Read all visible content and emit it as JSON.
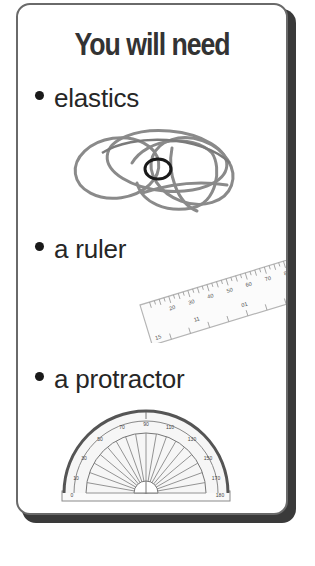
{
  "card": {
    "title": "You will need",
    "items": [
      {
        "label": "elastics",
        "icon": "elastic-bands-illustration"
      },
      {
        "label": "a ruler",
        "icon": "ruler-illustration"
      },
      {
        "label": "a protractor",
        "icon": "protractor-illustration"
      }
    ]
  },
  "ruler": {
    "top_labels": [
      "10",
      "20",
      "30",
      "40",
      "50",
      "60",
      "70",
      "80",
      "90",
      "100"
    ],
    "bottom_labels": [
      "15",
      "11",
      "01",
      "6"
    ]
  },
  "protractor": {
    "outer_labels": [
      "0",
      "10",
      "20",
      "30",
      "40",
      "50",
      "60",
      "70",
      "80",
      "90",
      "100",
      "110",
      "120",
      "130",
      "140",
      "150",
      "160",
      "170",
      "180"
    ],
    "inner_labels": [
      "180",
      "170",
      "160",
      "150",
      "140",
      "130",
      "120",
      "110",
      "100",
      "90",
      "80",
      "70",
      "60",
      "50",
      "40",
      "30",
      "20",
      "10",
      "0"
    ]
  },
  "colors": {
    "text": "#262626",
    "title": "#333333",
    "card_border": "#6a6a6a",
    "card_shadow": "#3a3a3a"
  }
}
